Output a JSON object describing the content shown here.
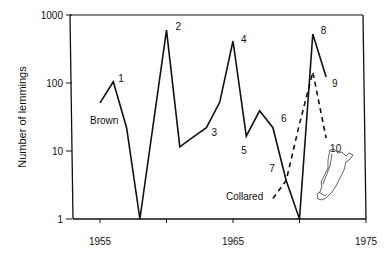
{
  "chart_data": {
    "type": "line",
    "title": "",
    "xlabel": "",
    "ylabel": "Number of lemmings",
    "yscale": "log",
    "ylim": [
      1,
      1000
    ],
    "xlim": [
      1955,
      1975
    ],
    "x_ticks": [
      1955,
      1960,
      1965,
      1970,
      1975
    ],
    "x_tick_labels": [
      "1955",
      "1965",
      "1975"
    ],
    "y_ticks": [
      1,
      10,
      100,
      1000
    ],
    "y_tick_labels": [
      "1",
      "10",
      "100",
      "1000"
    ],
    "grid": false,
    "legend": "inline",
    "series": [
      {
        "name": "Brown",
        "style": "solid",
        "x": [
          1955,
          1956,
          1957,
          1958,
          1960,
          1961,
          1962,
          1963,
          1964,
          1965,
          1966,
          1967,
          1968,
          1969,
          1970,
          1971,
          1972
        ],
        "values": [
          51,
          104,
          22,
          1,
          600,
          11.5,
          16,
          22,
          52,
          415,
          16.5,
          39,
          22,
          3.7,
          1,
          525,
          123
        ]
      },
      {
        "name": "Collared",
        "style": "dashed",
        "x": [
          1968,
          1969,
          1970,
          1971,
          1972
        ],
        "values": [
          2,
          3.7,
          25,
          145,
          15.5
        ]
      }
    ],
    "annotations": [
      {
        "text": "1",
        "x": 1956,
        "y": 104
      },
      {
        "text": "2",
        "x": 1960,
        "y": 600
      },
      {
        "text": "3",
        "x": 1963,
        "y": 22
      },
      {
        "text": "4",
        "x": 1965,
        "y": 415
      },
      {
        "text": "5",
        "x": 1966,
        "y": 16.5
      },
      {
        "text": "6",
        "x": 1968,
        "y": 22
      },
      {
        "text": "7",
        "x": 1969,
        "y": 3.7
      },
      {
        "text": "8",
        "x": 1971,
        "y": 525
      },
      {
        "text": "9",
        "x": 1972,
        "y": 123
      },
      {
        "text": "10",
        "x": 1972,
        "y": 15.5
      }
    ],
    "series_labels": [
      "Brown",
      "Collared"
    ],
    "inset": "island-map"
  }
}
